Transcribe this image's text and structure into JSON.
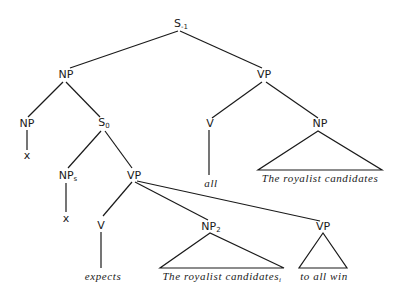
{
  "diagram": {
    "type": "syntax-tree",
    "nodes": {
      "root": {
        "label": "S",
        "sub": "-1"
      },
      "np_top": {
        "label": "NP"
      },
      "vp_top": {
        "label": "VP"
      },
      "np_left": {
        "label": "NP"
      },
      "x_left": {
        "label": "x"
      },
      "s0": {
        "label": "S",
        "sub": "0"
      },
      "v_right": {
        "label": "V"
      },
      "all": {
        "label": "all"
      },
      "np_right": {
        "label": "NP"
      },
      "royalist_right": {
        "label": "The royalist candidates"
      },
      "np_s": {
        "label": "NP",
        "sub": "s"
      },
      "vp_mid": {
        "label": "VP"
      },
      "x_mid": {
        "label": "x"
      },
      "v_mid": {
        "label": "V"
      },
      "expects": {
        "label": "expects"
      },
      "np_2": {
        "label": "NP",
        "sub": "2"
      },
      "royalist_bottom": {
        "label": "The royalist candidates",
        "sub": "i"
      },
      "vp_bottom": {
        "label": "VP"
      },
      "to_all_win": {
        "label": "to all win"
      }
    }
  }
}
